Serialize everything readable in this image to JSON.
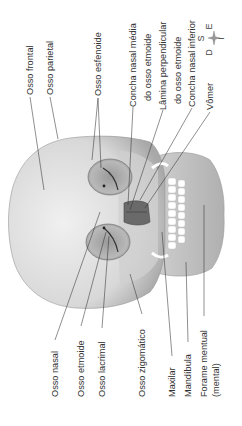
{
  "figure": {
    "orientation": "rotated 90° counter-clockwise"
  },
  "labels_top": [
    {
      "id": "osso-frontal",
      "lines": [
        "Osso frontal"
      ]
    },
    {
      "id": "osso-parietal",
      "lines": [
        "Osso parietal"
      ]
    },
    {
      "id": "osso-esfenoide",
      "lines": [
        "Osso esfenoide"
      ]
    },
    {
      "id": "concha-nasal-media",
      "lines": [
        "Concha nasal média",
        "do osso etmoide"
      ]
    },
    {
      "id": "lamina-perpendicular",
      "lines": [
        "Lâmina perpendicular",
        "do osso etmoide"
      ]
    },
    {
      "id": "concha-nasal-inferior",
      "lines": [
        "Concha nasal inferior"
      ]
    },
    {
      "id": "vomer",
      "lines": [
        "Vômer"
      ]
    }
  ],
  "labels_bottom": [
    {
      "id": "osso-nasal",
      "lines": [
        "Osso nasal"
      ]
    },
    {
      "id": "osso-etmoide",
      "lines": [
        "Osso etmoide"
      ]
    },
    {
      "id": "osso-lacrimal",
      "lines": [
        "Osso lacrimal"
      ]
    },
    {
      "id": "osso-zigomatico",
      "lines": [
        "Osso zigomático"
      ]
    },
    {
      "id": "maxilar",
      "lines": [
        "Maxilar"
      ]
    },
    {
      "id": "mandibula",
      "lines": [
        "Mandíbula"
      ]
    },
    {
      "id": "forame-mentual",
      "lines": [
        "Forame mentual",
        "(mental)"
      ]
    }
  ],
  "compass": {
    "superior": "S",
    "inferior": "I",
    "direita": "D",
    "esquerda": "E"
  },
  "colors": {
    "bone_light": "#e6e6e6",
    "bone_mid": "#c4c4c4",
    "bone_dark": "#8a8a8a",
    "cavity": "#555555",
    "leader": "#333333",
    "teeth": "#ffffff"
  }
}
